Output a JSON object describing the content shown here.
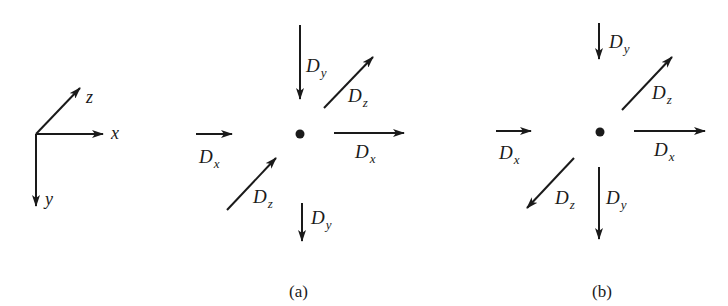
{
  "axes": {
    "x_label": "x",
    "y_label": "y",
    "z_label": "z"
  },
  "panel_a": {
    "caption": "(a)",
    "labels": {
      "dy_top_main": "D",
      "dy_top_sub": "y",
      "dz_top_main": "D",
      "dz_top_sub": "z",
      "dx_left_main": "D",
      "dx_left_sub": "x",
      "dx_right_main": "D",
      "dx_right_sub": "x",
      "dz_bottom_main": "D",
      "dz_bottom_sub": "z",
      "dy_bottom_main": "D",
      "dy_bottom_sub": "y"
    }
  },
  "panel_b": {
    "caption": "(b)",
    "labels": {
      "dy_top_main": "D",
      "dy_top_sub": "y",
      "dz_top_main": "D",
      "dz_top_sub": "z",
      "dx_left_main": "D",
      "dx_left_sub": "x",
      "dx_right_main": "D",
      "dx_right_sub": "x",
      "dz_bottom_main": "D",
      "dz_bottom_sub": "z",
      "dy_bottom_main": "D",
      "dy_bottom_sub": "y"
    }
  },
  "colors": {
    "ink": "#1a1a1a",
    "background": "#ffffff"
  }
}
